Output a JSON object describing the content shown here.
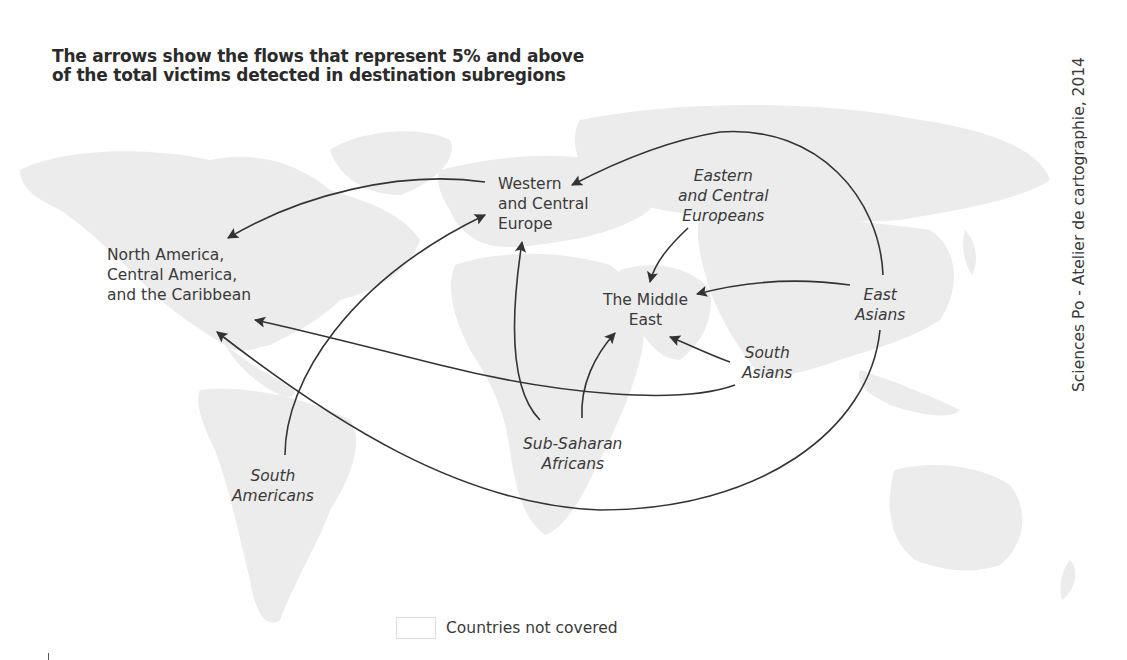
{
  "title": {
    "line1": "The arrows show the flows that represent 5% and above",
    "line2": "of the total victims detected in destination subregions"
  },
  "credit": "Sciences Po - Atelier de cartographie, 2014",
  "destinations": {
    "north_america": [
      "North America,",
      "Central America,",
      "and the Caribbean"
    ],
    "western_europe": [
      "Western",
      "and Central",
      "Europe"
    ],
    "middle_east": [
      "The Middle",
      "East"
    ]
  },
  "origins": {
    "eastern_europeans": [
      "Eastern",
      "and Central",
      "Europeans"
    ],
    "east_asians": [
      "East",
      "Asians"
    ],
    "south_asians": [
      "South",
      "Asians"
    ],
    "sub_saharan": [
      "Sub-Saharan",
      "Africans"
    ],
    "south_americans": [
      "South",
      "Americans"
    ]
  },
  "legend": {
    "countries_not_covered": "Countries not covered"
  },
  "flows": [
    {
      "from": "Western and Central Europe",
      "to": "North America, Central America, and the Caribbean"
    },
    {
      "from": "South Americans",
      "to": "Western and Central Europe"
    },
    {
      "from": "Sub-Saharan Africans",
      "to": "Western and Central Europe"
    },
    {
      "from": "Sub-Saharan Africans",
      "to": "The Middle East"
    },
    {
      "from": "East Asians",
      "to": "Western and Central Europe"
    },
    {
      "from": "East Asians",
      "to": "The Middle East"
    },
    {
      "from": "East Asians",
      "to": "North America, Central America, and the Caribbean"
    },
    {
      "from": "Eastern and Central Europeans",
      "to": "The Middle East"
    },
    {
      "from": "South Asians",
      "to": "The Middle East"
    },
    {
      "from": "South Asians",
      "to": "North America, Central America, and the Caribbean"
    }
  ],
  "colors": {
    "land": "#ececec",
    "arrow": "#333333",
    "text": "#3a3a3a",
    "background": "#ffffff"
  }
}
